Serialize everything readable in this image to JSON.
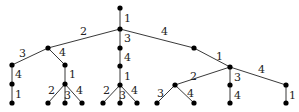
{
  "diagram": {
    "type": "tree",
    "nodes": [
      {
        "id": "root",
        "x": 120,
        "y": 8
      },
      {
        "id": "a",
        "x": 120,
        "y": 29
      },
      {
        "id": "b",
        "x": 48,
        "y": 48
      },
      {
        "id": "c",
        "x": 120,
        "y": 48
      },
      {
        "id": "d",
        "x": 194,
        "y": 48
      },
      {
        "id": "e",
        "x": 12,
        "y": 65
      },
      {
        "id": "f",
        "x": 65,
        "y": 65
      },
      {
        "id": "g",
        "x": 12,
        "y": 84
      },
      {
        "id": "h",
        "x": 12,
        "y": 103
      },
      {
        "id": "i",
        "x": 65,
        "y": 84
      },
      {
        "id": "j",
        "x": 48,
        "y": 103
      },
      {
        "id": "k",
        "x": 65,
        "y": 103
      },
      {
        "id": "l",
        "x": 82,
        "y": 103
      },
      {
        "id": "m",
        "x": 120,
        "y": 66
      },
      {
        "id": "n",
        "x": 120,
        "y": 85
      },
      {
        "id": "o",
        "x": 103,
        "y": 103
      },
      {
        "id": "p",
        "x": 120,
        "y": 103
      },
      {
        "id": "q",
        "x": 137,
        "y": 103
      },
      {
        "id": "r",
        "x": 230,
        "y": 67
      },
      {
        "id": "s",
        "x": 175,
        "y": 85
      },
      {
        "id": "t",
        "x": 230,
        "y": 85
      },
      {
        "id": "u",
        "x": 286,
        "y": 85
      },
      {
        "id": "v",
        "x": 157,
        "y": 103
      },
      {
        "id": "w",
        "x": 194,
        "y": 103
      },
      {
        "id": "x",
        "x": 230,
        "y": 103
      },
      {
        "id": "y",
        "x": 286,
        "y": 103
      }
    ],
    "edges": [
      {
        "from": "root",
        "to": "a",
        "label": "1",
        "lx": 124,
        "ly": 22
      },
      {
        "from": "a",
        "to": "b",
        "label": "2",
        "lx": 80,
        "ly": 35
      },
      {
        "from": "a",
        "to": "c",
        "label": "3",
        "lx": 124,
        "ly": 42
      },
      {
        "from": "a",
        "to": "d",
        "label": "4",
        "lx": 161,
        "ly": 35
      },
      {
        "from": "b",
        "to": "e",
        "label": "3",
        "lx": 19,
        "ly": 57
      },
      {
        "from": "b",
        "to": "f",
        "label": "4",
        "lx": 59,
        "ly": 56
      },
      {
        "from": "e",
        "to": "g",
        "label": "4",
        "lx": 15,
        "ly": 78
      },
      {
        "from": "g",
        "to": "h",
        "label": "1",
        "lx": 15,
        "ly": 98
      },
      {
        "from": "f",
        "to": "i",
        "label": "1",
        "lx": 69,
        "ly": 78
      },
      {
        "from": "i",
        "to": "j",
        "label": "2",
        "lx": 48,
        "ly": 94
      },
      {
        "from": "i",
        "to": "k",
        "label": "3",
        "lx": 64,
        "ly": 99
      },
      {
        "from": "i",
        "to": "l",
        "label": "4",
        "lx": 76,
        "ly": 94
      },
      {
        "from": "c",
        "to": "m",
        "label": "4",
        "lx": 124,
        "ly": 61
      },
      {
        "from": "m",
        "to": "n",
        "label": "1",
        "lx": 124,
        "ly": 80
      },
      {
        "from": "n",
        "to": "o",
        "label": "2",
        "lx": 103,
        "ly": 94
      },
      {
        "from": "n",
        "to": "p",
        "label": "3",
        "lx": 119,
        "ly": 99
      },
      {
        "from": "n",
        "to": "q",
        "label": "4",
        "lx": 131,
        "ly": 94
      },
      {
        "from": "d",
        "to": "r",
        "label": "1",
        "lx": 216,
        "ly": 60
      },
      {
        "from": "r",
        "to": "s",
        "label": "2",
        "lx": 190,
        "ly": 80
      },
      {
        "from": "r",
        "to": "t",
        "label": "3",
        "lx": 234,
        "ly": 81
      },
      {
        "from": "r",
        "to": "u",
        "label": "4",
        "lx": 258,
        "ly": 73
      },
      {
        "from": "s",
        "to": "v",
        "label": "3",
        "lx": 157,
        "ly": 97
      },
      {
        "from": "s",
        "to": "w",
        "label": "4",
        "lx": 187,
        "ly": 97
      },
      {
        "from": "t",
        "to": "x",
        "label": "4",
        "lx": 234,
        "ly": 99
      },
      {
        "from": "u",
        "to": "y",
        "label": "1",
        "lx": 289,
        "ly": 99
      }
    ]
  }
}
